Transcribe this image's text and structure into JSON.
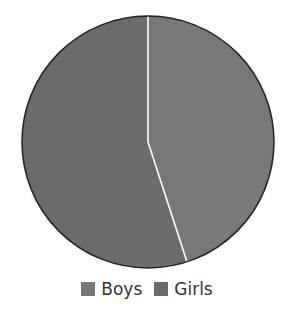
{
  "chart_data": {
    "type": "pie",
    "title": "",
    "categories": [
      "Boys",
      "Girls"
    ],
    "values": [
      45,
      55
    ],
    "colors": [
      "#787878",
      "#6c6c6c"
    ],
    "start_angle_deg": 0,
    "direction": "clockwise",
    "legend_position": "bottom",
    "edge_color": "#222222",
    "separator_color": "#ffffff"
  },
  "legend": {
    "items": [
      {
        "label": "Boys",
        "color": "#787878"
      },
      {
        "label": "Girls",
        "color": "#6c6c6c"
      }
    ]
  }
}
